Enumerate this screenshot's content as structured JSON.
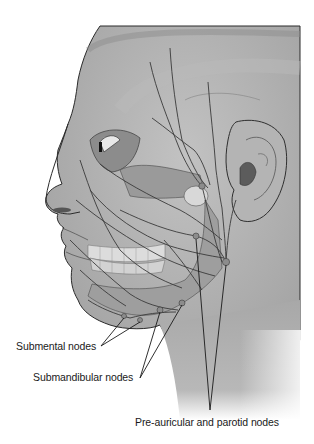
{
  "figure": {
    "colors": {
      "background": "#ffffff",
      "skin": "#a9a9a9",
      "skin_light": "#c4c4c4",
      "shadow": "#7a7a7a",
      "vessel": "#3a3a3a",
      "outline": "#2b2b2b"
    }
  },
  "labels": {
    "submental": "Submental nodes",
    "submandibular": "Submandibular nodes",
    "preauricular": "Pre-auricular and parotid nodes"
  }
}
